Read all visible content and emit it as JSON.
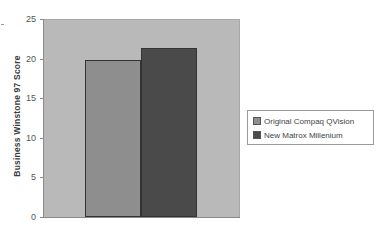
{
  "chart_data": {
    "type": "bar",
    "title": "",
    "xlabel": "",
    "ylabel": "Business Winstone 97 Score",
    "ylim": [
      0,
      25
    ],
    "yticks": [
      0,
      5,
      10,
      15,
      20,
      25
    ],
    "categories": [
      ""
    ],
    "series": [
      {
        "name": "Original Compaq QVision",
        "values": [
          19.8
        ],
        "color": "#8e8e8e"
      },
      {
        "name": "New  Matrox Millenium",
        "values": [
          21.3
        ],
        "color": "#4a4a4a"
      }
    ],
    "grid": false,
    "legend_position": "right",
    "plot_background": "#b9b9b9"
  },
  "axis": {
    "ylabel": "Business Winstone 97 Score",
    "ticks": [
      "0",
      "5",
      "10",
      "15",
      "20",
      "25"
    ]
  },
  "legend": {
    "items": [
      {
        "label": "Original Compaq QVision",
        "color": "#8e8e8e"
      },
      {
        "label": "New  Matrox Millenium",
        "color": "#4a4a4a"
      }
    ]
  }
}
